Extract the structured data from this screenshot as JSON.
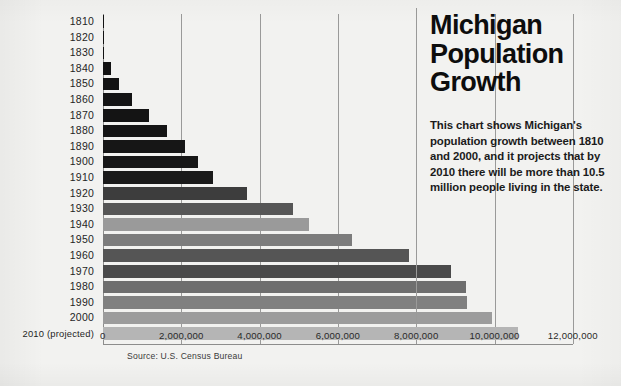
{
  "info": {
    "title": "Michigan Population Growth",
    "description": "This chart shows Michigan's population growth between 1810 and 2000, and it projects that by 2010 there will be more than 10.5 million people living in the state."
  },
  "source_note": "Source: U.S. Census Bureau",
  "chart_data": {
    "type": "bar",
    "orientation": "horizontal",
    "title": "Michigan Population Growth",
    "xlabel": "",
    "ylabel": "",
    "xlim": [
      0,
      12000000
    ],
    "grid": true,
    "legend": null,
    "xticks": [
      0,
      2000000,
      4000000,
      6000000,
      8000000,
      10000000,
      12000000
    ],
    "xtick_labels": [
      "0",
      "2,000,000",
      "4,000,000",
      "6,000,000",
      "8,000,000",
      "10,000,000",
      "12,000,000"
    ],
    "categories": [
      "1810",
      "1820",
      "1830",
      "1840",
      "1850",
      "1860",
      "1870",
      "1880",
      "1890",
      "1900",
      "1910",
      "1920",
      "1930",
      "1940",
      "1950",
      "1960",
      "1970",
      "1980",
      "1990",
      "2000",
      "2010 (projected)"
    ],
    "values": [
      4762,
      8896,
      31639,
      212267,
      397654,
      749113,
      1184059,
      1636937,
      2093890,
      2420982,
      2810173,
      3668412,
      4842325,
      5256106,
      6371766,
      7823194,
      8881826,
      9262078,
      9295297,
      9938444,
      10590000
    ],
    "bar_colors": [
      "#121212",
      "#121212",
      "#121212",
      "#121212",
      "#131313",
      "#141414",
      "#141414",
      "#151515",
      "#161616",
      "#171717",
      "#1a1a1a",
      "#3d3d3d",
      "#565656",
      "#9a9a9a",
      "#7c7c7c",
      "#555555",
      "#4a4a4a",
      "#6e6e6e",
      "#808080",
      "#9c9c9c",
      "#b5b5b5"
    ]
  }
}
